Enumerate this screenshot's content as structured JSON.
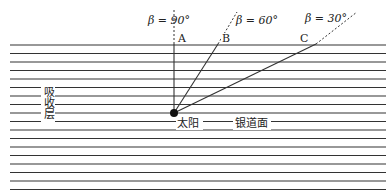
{
  "diagram": {
    "colors": {
      "line": "#333333",
      "background": "#ffffff"
    },
    "disk_lines": {
      "count": 18,
      "x_start": 10,
      "x_end": 386,
      "y_start": 45,
      "spacing": 8.5
    },
    "sun": {
      "x": 174,
      "y": 113,
      "label": "太阳"
    },
    "plane_label": "银道面",
    "layer_label": "吸收层",
    "rays": [
      {
        "name": "A",
        "beta": "β = 90°",
        "end_x": 174,
        "end_y": 44,
        "dash_end_x": 174,
        "dash_end_y": 10,
        "label_x": 178,
        "label_y": 42,
        "beta_x": 148,
        "beta_y": 24
      },
      {
        "name": "B",
        "beta": "β = 60°",
        "end_x": 218,
        "end_y": 44,
        "dash_end_x": 237,
        "dash_end_y": 12,
        "label_x": 222,
        "label_y": 42,
        "beta_x": 236,
        "beta_y": 24
      },
      {
        "name": "C",
        "beta": "β = 30°",
        "end_x": 316,
        "end_y": 44,
        "dash_end_x": 357,
        "dash_end_y": 12,
        "label_x": 300,
        "label_y": 42,
        "beta_x": 305,
        "beta_y": 22
      }
    ]
  }
}
